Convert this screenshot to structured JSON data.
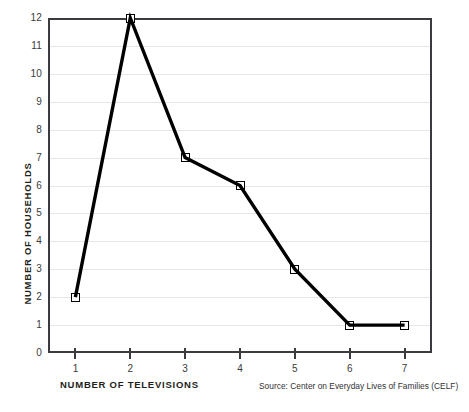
{
  "chart_data": {
    "type": "line",
    "title": "",
    "subtitle": "",
    "xlabel": "NUMBER OF TELEVISIONS",
    "ylabel": "NUMBER OF HOUSEHOLDS",
    "x": [
      1,
      2,
      3,
      4,
      5,
      6,
      7
    ],
    "values": [
      2,
      12,
      7,
      6,
      3,
      1,
      1
    ],
    "series": [
      {
        "name": "Number of households",
        "values": [
          2,
          12,
          7,
          6,
          3,
          1,
          1
        ]
      }
    ],
    "xlim": [
      0.5,
      7.5
    ],
    "ylim": [
      0,
      12
    ],
    "x_tick_labels": [
      "1",
      "2",
      "3",
      "4",
      "5",
      "6",
      "7"
    ],
    "y_tick_labels": [
      "0",
      "1",
      "2",
      "3",
      "4",
      "5",
      "6",
      "7",
      "8",
      "9",
      "10",
      "11",
      "12"
    ],
    "y_ticks": [
      0,
      1,
      2,
      3,
      4,
      5,
      6,
      7,
      8,
      9,
      10,
      11,
      12
    ],
    "grid": "horizontal",
    "legend": "none",
    "annotations": [
      "Source: Center on Everyday Lives of Families (CELF)"
    ],
    "marker_style": "open-square",
    "line_color": "#000000",
    "grid_color": "#e6e6e6",
    "axis_color": "#3b3b3f",
    "background_color": "#ffffff"
  },
  "footer": {
    "source": "Source: Center on Everyday Lives of Families (CELF)"
  }
}
